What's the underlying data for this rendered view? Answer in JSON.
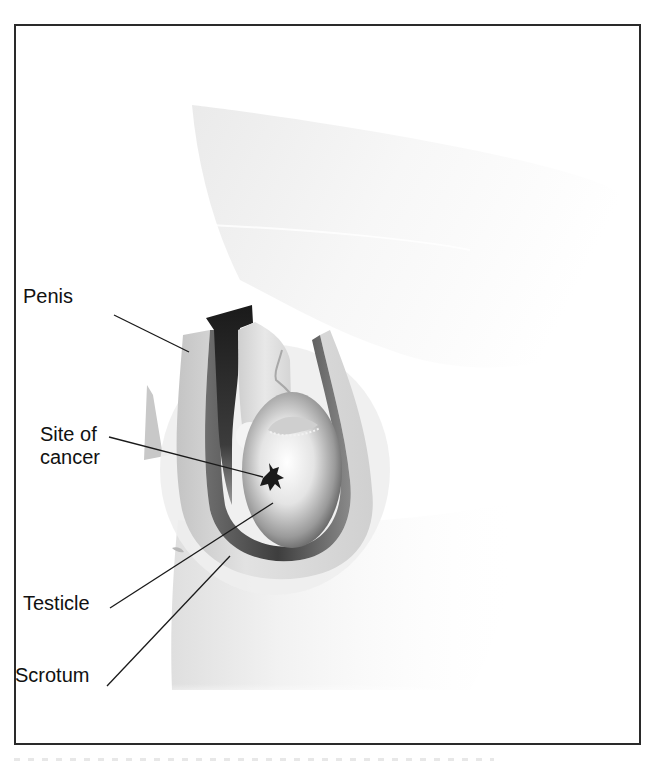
{
  "figure": {
    "type": "anatomical illustration",
    "frame_color": "#2a2a2a",
    "background": "#ffffff"
  },
  "labels": {
    "penis": "Penis",
    "site_line1": "Site of",
    "site_line2": "cancer",
    "testicle": "Testicle",
    "scrotum": "Scrotum"
  },
  "colors": {
    "tumor": "#1a1a1a",
    "penis_shadow": "#2b2b2b",
    "tissue_light": "#e6e6e6",
    "tissue_mid": "#b5b5b5",
    "tissue_dark": "#555555",
    "leader_line": "#1a1a1a"
  }
}
